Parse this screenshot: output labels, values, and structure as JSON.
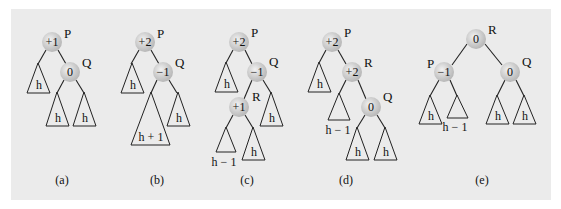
{
  "figure": {
    "background": "#ebebeb",
    "node_fill": "#c8c8c8",
    "panels": [
      {
        "caption": "(a)",
        "nodes": [
          {
            "id": "P",
            "balance": "+1",
            "label": "P",
            "x": 52,
            "y": 42
          },
          {
            "id": "Q",
            "balance": "0",
            "label": "Q",
            "x": 70,
            "y": 72
          }
        ],
        "subtrees": [
          {
            "label": "h",
            "parent": "P",
            "side": "left"
          },
          {
            "label": "h",
            "parent": "Q",
            "side": "left"
          },
          {
            "label": "h",
            "parent": "Q",
            "side": "right"
          }
        ]
      },
      {
        "caption": "(b)",
        "nodes": [
          {
            "id": "P",
            "balance": "+2",
            "label": "P",
            "x": 145,
            "y": 42
          },
          {
            "id": "Q",
            "balance": "−1",
            "label": "Q",
            "x": 163,
            "y": 72
          }
        ],
        "subtrees": [
          {
            "label": "h",
            "parent": "P",
            "side": "left"
          },
          {
            "label": "h + 1",
            "parent": "Q",
            "side": "left"
          },
          {
            "label": "h",
            "parent": "Q",
            "side": "right"
          }
        ]
      },
      {
        "caption": "(c)",
        "nodes": [
          {
            "id": "P",
            "balance": "+2",
            "label": "P",
            "x": 239,
            "y": 42
          },
          {
            "id": "Q",
            "balance": "−1",
            "label": "Q",
            "x": 257,
            "y": 72
          },
          {
            "id": "R",
            "balance": "+1",
            "label": "R",
            "x": 239,
            "y": 107
          }
        ],
        "subtrees": [
          {
            "label": "h",
            "parent": "P",
            "side": "left"
          },
          {
            "label": "h",
            "parent": "Q",
            "side": "right"
          },
          {
            "label": "h − 1",
            "parent": "R",
            "side": "left"
          },
          {
            "label": "h",
            "parent": "R",
            "side": "right"
          }
        ]
      },
      {
        "caption": "(d)",
        "nodes": [
          {
            "id": "P",
            "balance": "+2",
            "label": "P",
            "x": 332,
            "y": 42
          },
          {
            "id": "R",
            "balance": "+2",
            "label": "R",
            "x": 352,
            "y": 72
          },
          {
            "id": "Q",
            "balance": "0",
            "label": "Q",
            "x": 371,
            "y": 107
          }
        ],
        "subtrees": [
          {
            "label": "h",
            "parent": "P",
            "side": "left"
          },
          {
            "label": "h − 1",
            "parent": "R",
            "side": "left"
          },
          {
            "label": "h",
            "parent": "Q",
            "side": "left"
          },
          {
            "label": "h",
            "parent": "Q",
            "side": "right"
          }
        ]
      },
      {
        "caption": "(e)",
        "nodes": [
          {
            "id": "R",
            "balance": "0",
            "label": "R",
            "x": 476,
            "y": 39
          },
          {
            "id": "P",
            "balance": "−1",
            "label": "P",
            "x": 444,
            "y": 72
          },
          {
            "id": "Q",
            "balance": "0",
            "label": "Q",
            "x": 510,
            "y": 72
          }
        ],
        "subtrees": [
          {
            "label": "h",
            "parent": "P",
            "side": "left"
          },
          {
            "label": "h − 1",
            "parent": "P",
            "side": "right"
          },
          {
            "label": "h",
            "parent": "Q",
            "side": "left"
          },
          {
            "label": "h",
            "parent": "Q",
            "side": "right"
          }
        ]
      }
    ]
  }
}
